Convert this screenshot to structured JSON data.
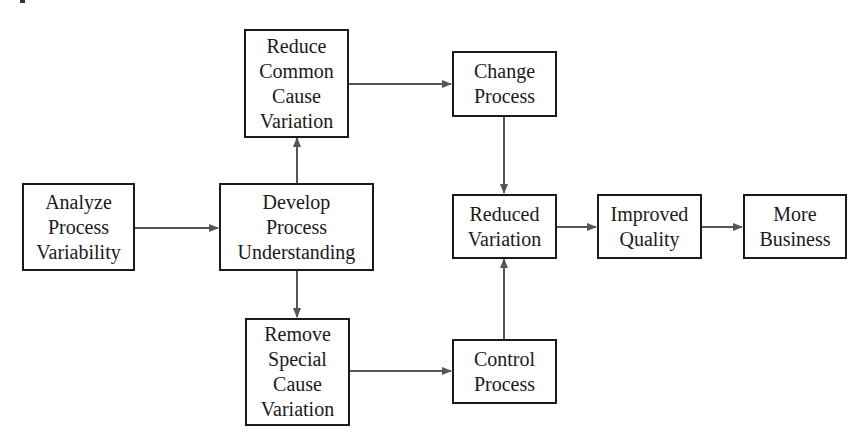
{
  "diagram": {
    "type": "flowchart",
    "colors": {
      "stroke": "#1a1a1a",
      "arrow": "#555555",
      "background": "#ffffff"
    },
    "nodes": {
      "analyze": {
        "lines": [
          "Analyze",
          "Process",
          "Variability"
        ]
      },
      "develop": {
        "lines": [
          "Develop",
          "Process",
          "Understanding"
        ]
      },
      "reduce_common": {
        "lines": [
          "Reduce",
          "Common",
          "Cause",
          "Variation"
        ]
      },
      "remove_special": {
        "lines": [
          "Remove",
          "Special",
          "Cause",
          "Variation"
        ]
      },
      "change_process": {
        "lines": [
          "Change",
          "Process"
        ]
      },
      "control_process": {
        "lines": [
          "Control",
          "Process"
        ]
      },
      "reduced_variation": {
        "lines": [
          "Reduced",
          "Variation"
        ]
      },
      "improved_quality": {
        "lines": [
          "Improved",
          "Quality"
        ]
      },
      "more_business": {
        "lines": [
          "More",
          "Business"
        ]
      }
    },
    "edges": [
      {
        "from": "Analyze Process Variability",
        "to": "Develop Process Understanding"
      },
      {
        "from": "Develop Process Understanding",
        "to": "Reduce Common Cause Variation"
      },
      {
        "from": "Develop Process Understanding",
        "to": "Remove Special Cause Variation"
      },
      {
        "from": "Reduce Common Cause Variation",
        "to": "Change Process"
      },
      {
        "from": "Remove Special Cause Variation",
        "to": "Control Process"
      },
      {
        "from": "Change Process",
        "to": "Reduced Variation"
      },
      {
        "from": "Control Process",
        "to": "Reduced Variation"
      },
      {
        "from": "Reduced Variation",
        "to": "Improved Quality"
      },
      {
        "from": "Improved Quality",
        "to": "More Business"
      }
    ]
  }
}
